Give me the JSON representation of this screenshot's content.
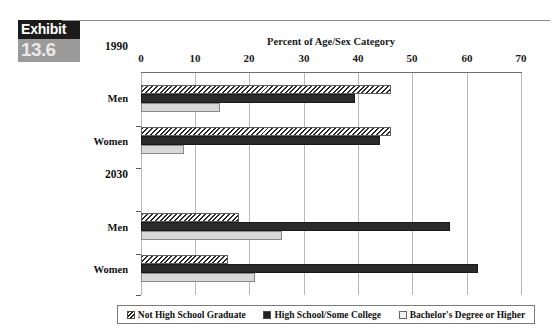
{
  "exhibit": {
    "word": "Exhibit",
    "number": "13.6"
  },
  "chart_data": {
    "type": "bar",
    "orientation": "horizontal",
    "title": "Percent of Age/Sex Category",
    "xlabel": "Percent of Age/Sex Category",
    "ylabel": "",
    "xlim": [
      0,
      70
    ],
    "xticks": [
      0,
      10,
      20,
      30,
      40,
      50,
      60,
      70
    ],
    "xtick_labels": [
      "0",
      "10",
      "20",
      "30",
      "40",
      "50",
      "60",
      "70"
    ],
    "grid": true,
    "legend_position": "bottom",
    "group_labels": [
      "1990",
      "2030"
    ],
    "categories": [
      "Men",
      "Women",
      "Men",
      "Women"
    ],
    "groups": [
      {
        "label": "1990",
        "rows": [
          {
            "label": "Men",
            "values": [
              46.0,
              39.5,
              14.5
            ]
          },
          {
            "label": "Women",
            "values": [
              46.0,
              44.0,
              8.0
            ]
          }
        ]
      },
      {
        "label": "2030",
        "rows": [
          {
            "label": "Men",
            "values": [
              18.0,
              57.0,
              26.0
            ]
          },
          {
            "label": "Women",
            "values": [
              16.0,
              62.0,
              21.0
            ]
          }
        ]
      }
    ],
    "series": [
      {
        "name": "Not High School Graduate",
        "values": [
          46.0,
          46.0,
          18.0,
          16.0
        ],
        "fill": "hatched"
      },
      {
        "name": "High School/Some College",
        "values": [
          39.5,
          44.0,
          57.0,
          62.0
        ],
        "fill": "solid-dark"
      },
      {
        "name": "Bachelor's Degree or Higher",
        "values": [
          14.5,
          8.0,
          26.0,
          21.0
        ],
        "fill": "light-gray"
      }
    ],
    "legend": [
      "Not High School Graduate",
      "High School/Some College",
      "Bachelor's Degree or Higher"
    ]
  },
  "colors": {
    "badge_top_bg": "#1b1b1b",
    "badge_bottom_bg": "#9a9a9a",
    "series_dark": "#2b2b2b",
    "series_light": "#d8d8d8",
    "gridline": "#b9b9b9"
  }
}
